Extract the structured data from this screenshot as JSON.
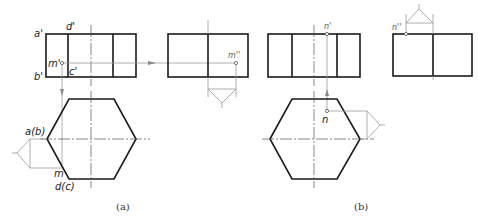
{
  "figure": {
    "a": {
      "caption": "(a)",
      "front_view_labels": {
        "a_prime": "a'",
        "d_prime": "d'",
        "b_prime": "b'",
        "c_prime": "c'",
        "m_prime": "m'"
      },
      "side_view_labels": {
        "m_double_prime": "m''"
      },
      "top_view_labels": {
        "a_b": "a(b)",
        "m": "m",
        "d_c": "d(c)"
      }
    },
    "b": {
      "caption": "(b)",
      "front_view_labels": {
        "n_prime": "n'"
      },
      "side_view_labels": {
        "n_double_prime": "n''"
      },
      "top_view_labels": {
        "n": "n"
      }
    },
    "colors": {
      "outline": "#1a1a1a",
      "construction": "#9a9a9a",
      "centerline": "#555555"
    }
  }
}
